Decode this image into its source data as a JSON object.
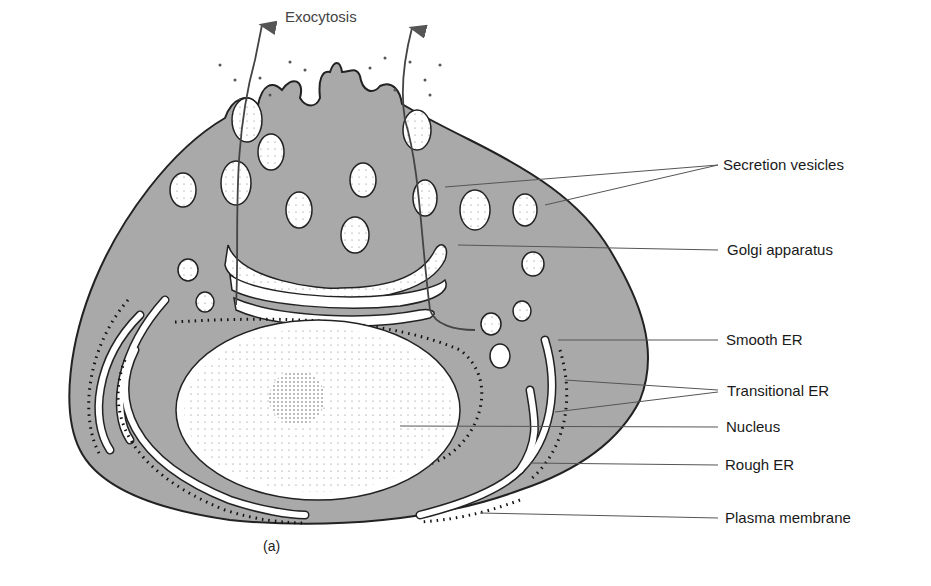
{
  "figure": {
    "caption": "(a)",
    "top_label": "Exocytosis",
    "labels": [
      {
        "id": "secretion-vesicles",
        "text": "Secretion vesicles"
      },
      {
        "id": "golgi-apparatus",
        "text": "Golgi apparatus"
      },
      {
        "id": "smooth-er",
        "text": "Smooth ER"
      },
      {
        "id": "transitional-er",
        "text": "Transitional ER"
      },
      {
        "id": "nucleus",
        "text": "Nucleus"
      },
      {
        "id": "rough-er",
        "text": "Rough ER"
      },
      {
        "id": "plasma-membrane",
        "text": "Plasma membrane"
      }
    ],
    "colors": {
      "cytoplasm": "#a9a9a9",
      "outline": "#222222",
      "organelle_fill": "#ffffff",
      "leader_line": "#555555"
    }
  }
}
